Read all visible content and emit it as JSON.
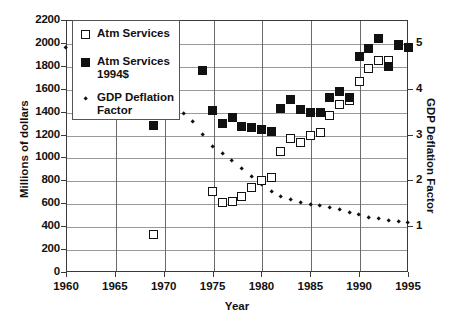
{
  "chart_data": {
    "type": "scatter",
    "title": "",
    "xlabel": "Year",
    "ylabel": "Millions of dollars",
    "ylabel_right": "GDP Deflation Factor",
    "xlim": [
      1960,
      1995
    ],
    "ylim": [
      0,
      2200
    ],
    "ylim_right": [
      0,
      5.5
    ],
    "xticks": [
      1960,
      1965,
      1970,
      1975,
      1980,
      1985,
      1990,
      1995
    ],
    "yticks": [
      0,
      200,
      400,
      600,
      800,
      1000,
      1200,
      1400,
      1600,
      1800,
      2000,
      2200
    ],
    "yticks_right": [
      1,
      2,
      3,
      4,
      5
    ],
    "grid": true,
    "legend_position": "top-left",
    "series": [
      {
        "name": "Atm Services",
        "marker": "open-square",
        "axis": "left",
        "points": [
          [
            1969,
            330
          ],
          [
            1975,
            700
          ],
          [
            1976,
            610
          ],
          [
            1977,
            615
          ],
          [
            1978,
            655
          ],
          [
            1979,
            740
          ],
          [
            1980,
            800
          ],
          [
            1981,
            825
          ],
          [
            1982,
            1050
          ],
          [
            1983,
            1165
          ],
          [
            1984,
            1130
          ],
          [
            1985,
            1190
          ],
          [
            1986,
            1215
          ],
          [
            1987,
            1370
          ],
          [
            1988,
            1460
          ],
          [
            1989,
            1500
          ],
          [
            1990,
            1660
          ],
          [
            1991,
            1780
          ],
          [
            1992,
            1845
          ],
          [
            1993,
            1850
          ],
          [
            1994,
            1985
          ],
          [
            1995,
            1960
          ]
        ]
      },
      {
        "name": "Atm Services\n1994$",
        "marker": "filled-square",
        "axis": "left",
        "points": [
          [
            1969,
            1280
          ],
          [
            1974,
            1755
          ],
          [
            1975,
            1410
          ],
          [
            1976,
            1300
          ],
          [
            1977,
            1350
          ],
          [
            1978,
            1270
          ],
          [
            1979,
            1265
          ],
          [
            1980,
            1240
          ],
          [
            1981,
            1225
          ],
          [
            1982,
            1430
          ],
          [
            1983,
            1510
          ],
          [
            1984,
            1415
          ],
          [
            1985,
            1390
          ],
          [
            1986,
            1395
          ],
          [
            1987,
            1525
          ],
          [
            1988,
            1575
          ],
          [
            1989,
            1520
          ],
          [
            1990,
            1880
          ],
          [
            1991,
            1955
          ],
          [
            1992,
            2040
          ],
          [
            1993,
            1790
          ],
          [
            1994,
            1975
          ],
          [
            1995,
            1960
          ]
        ]
      },
      {
        "name": "GDP Deflation\nFactor",
        "marker": "diamond-dot",
        "axis": "right",
        "points": [
          [
            1960,
            4.9
          ],
          [
            1961,
            4.84
          ],
          [
            1962,
            4.78
          ],
          [
            1963,
            4.72
          ],
          [
            1964,
            4.66
          ],
          [
            1965,
            4.58
          ],
          [
            1966,
            4.45
          ],
          [
            1967,
            4.33
          ],
          [
            1968,
            4.15
          ],
          [
            1969,
            3.96
          ],
          [
            1970,
            3.78
          ],
          [
            1971,
            3.6
          ],
          [
            1972,
            3.45
          ],
          [
            1973,
            3.27
          ],
          [
            1974,
            3.0
          ],
          [
            1975,
            2.74
          ],
          [
            1976,
            2.59
          ],
          [
            1977,
            2.43
          ],
          [
            1978,
            2.26
          ],
          [
            1979,
            2.08
          ],
          [
            1980,
            1.91
          ],
          [
            1981,
            1.75
          ],
          [
            1982,
            1.65
          ],
          [
            1983,
            1.58
          ],
          [
            1984,
            1.52
          ],
          [
            1985,
            1.47
          ],
          [
            1986,
            1.44
          ],
          [
            1987,
            1.4
          ],
          [
            1988,
            1.35
          ],
          [
            1989,
            1.29
          ],
          [
            1990,
            1.24
          ],
          [
            1991,
            1.19
          ],
          [
            1992,
            1.16
          ],
          [
            1993,
            1.13
          ],
          [
            1994,
            1.1
          ],
          [
            1995,
            1.07
          ]
        ]
      }
    ]
  },
  "legend": {
    "items": [
      {
        "label": "Atm Services",
        "marker": "open-square"
      },
      {
        "label": "Atm Services\n1994$",
        "marker": "filled-square"
      },
      {
        "label": "GDP Deflation\nFactor",
        "marker": "diamond-dot"
      }
    ]
  }
}
